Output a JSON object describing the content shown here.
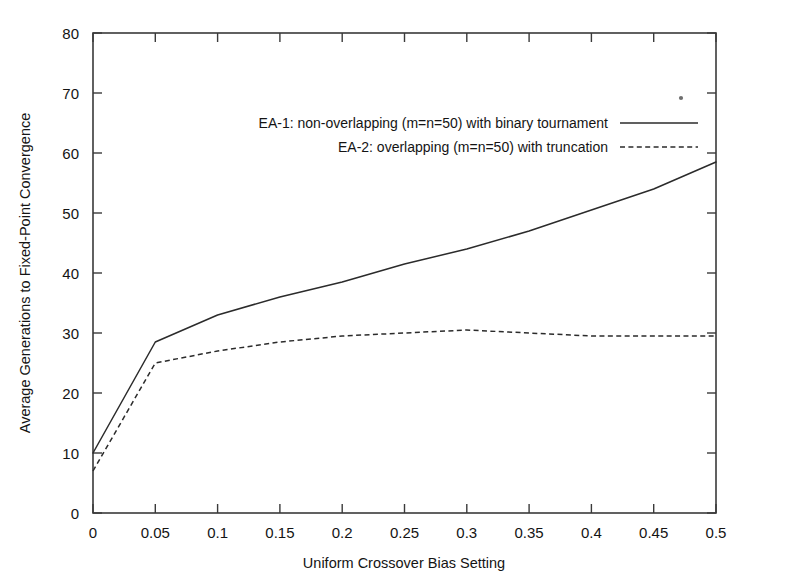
{
  "chart_data": {
    "type": "line",
    "title": "",
    "xlabel": "Uniform Crossover Bias Setting",
    "ylabel": "Average Generations to Fixed-Point Convergence",
    "xlim": [
      0,
      0.5
    ],
    "ylim": [
      0,
      80
    ],
    "grid": false,
    "legend_position": "upper-left-inside",
    "x_ticks": [
      0,
      0.05,
      0.1,
      0.15,
      0.2,
      0.25,
      0.3,
      0.35,
      0.4,
      0.45,
      0.5
    ],
    "x_tick_labels": [
      "0",
      "0.05",
      "0.1",
      "0.15",
      "0.2",
      "0.25",
      "0.3",
      "0.35",
      "0.4",
      "0.45",
      "0.5"
    ],
    "y_ticks": [
      0,
      10,
      20,
      30,
      40,
      50,
      60,
      70,
      80
    ],
    "y_tick_labels": [
      "0",
      "10",
      "20",
      "30",
      "40",
      "50",
      "60",
      "70",
      "80"
    ],
    "x": [
      0,
      0.05,
      0.1,
      0.15,
      0.2,
      0.25,
      0.3,
      0.35,
      0.4,
      0.45,
      0.5
    ],
    "series": [
      {
        "name": "EA-1: non-overlapping (m=n=50) with binary tournament",
        "style": "solid",
        "color": "#2b2b2b",
        "values": [
          10,
          28.5,
          33,
          36,
          38.5,
          41.5,
          44,
          47,
          50.5,
          54,
          58.5
        ]
      },
      {
        "name": "EA-2: overlapping (m=n=50) with truncation",
        "style": "dashed",
        "color": "#2b2b2b",
        "values": [
          7,
          25,
          27,
          28.5,
          29.5,
          30,
          30.5,
          30,
          29.5,
          29.5,
          29.5
        ]
      }
    ]
  },
  "legend": {
    "entries": [
      {
        "label": "EA-1: non-overlapping (m=n=50) with binary tournament",
        "style": "solid"
      },
      {
        "label": "EA-2: overlapping (m=n=50) with truncation",
        "style": "dashed"
      }
    ]
  },
  "axes": {
    "x_title": "Uniform Crossover Bias Setting",
    "y_title": "Average Generations to Fixed-Point Convergence"
  }
}
